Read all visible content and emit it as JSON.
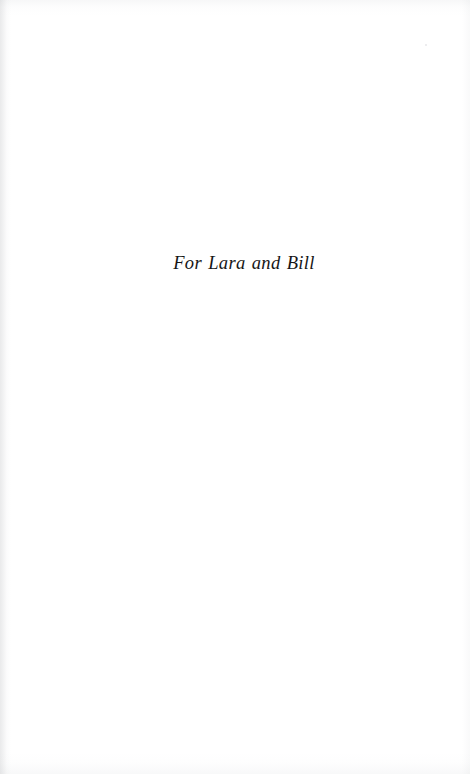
{
  "page": {
    "kind": "book-dedication-page",
    "background_color": "#ffffff",
    "ink_color": "#161616",
    "width": 470,
    "height": 774
  },
  "dedication": {
    "text": "For Lara and Bill"
  },
  "artifacts": {
    "gutter_shadow_side": "left",
    "speck_visible": true
  }
}
